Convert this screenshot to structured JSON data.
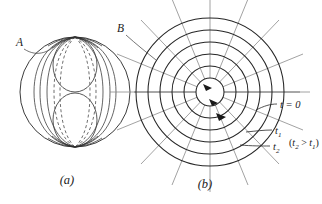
{
  "figure": {
    "panels": [
      {
        "caption": "(a)",
        "point_label": "A",
        "description": "sphere-with-figure-eight-field-lines"
      },
      {
        "caption": "(b)",
        "point_label": "B",
        "description": "concentric-circles-with-radial-grid",
        "annotations": [
          {
            "text": "t = 0"
          },
          {
            "text": "t",
            "subscript": "1"
          },
          {
            "text": "t",
            "subscript": "2"
          }
        ],
        "inequality": {
          "open": "(",
          "var_a": "t",
          "sub_a": "2",
          "relation": " > ",
          "var_b": "t",
          "sub_b": "1",
          "close": ")"
        }
      }
    ],
    "colors": {
      "ink": "#1a1a1a",
      "curve_dark": "#262626",
      "curve_mid": "#555555",
      "curve_gray": "#8a8a8a",
      "background": "#ffffff"
    }
  }
}
